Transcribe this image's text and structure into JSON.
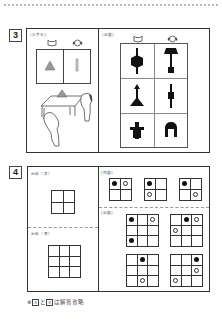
{
  "section3": {
    "number": "3",
    "model_panel": {
      "label": "[お手本]",
      "characters": [
        "cat-icon",
        "dog-icon"
      ],
      "cells": [
        "gray-triangle",
        "gray-bar"
      ]
    },
    "question_panel": {
      "label": "[出題]",
      "characters": [
        "cat-icon",
        "dog-icon"
      ],
      "rows": [
        [
          "hexagon-on-stick",
          "lamp-shape"
        ],
        [
          "arrow-on-triangle",
          "stick-with-square"
        ],
        [
          "cross-block",
          "arch-table"
        ]
      ]
    }
  },
  "section4": {
    "number": "4",
    "left_panel": {
      "top_label": "台紙（表）",
      "bottom_label": "台紙（裏）",
      "top_grid": {
        "rows": 2,
        "cols": 2
      },
      "bottom_grid": {
        "rows": 3,
        "cols": 3
      }
    },
    "right_panel": {
      "example_label": "[例題]",
      "question_label": "[出題]",
      "examples": [
        {
          "rows": 2,
          "cols": 2,
          "black": [
            [
              0,
              0
            ]
          ],
          "white": [
            [
              0,
              1
            ]
          ]
        },
        {
          "rows": 2,
          "cols": 2,
          "black": [
            [
              0,
              0
            ]
          ],
          "white": [
            [
              1,
              0
            ]
          ]
        },
        {
          "rows": 2,
          "cols": 2,
          "black": [
            [
              0,
              0
            ]
          ],
          "white": [
            [
              1,
              1
            ]
          ]
        }
      ],
      "questions": [
        {
          "rows": 3,
          "cols": 3,
          "black": [
            [
              0,
              0
            ],
            [
              2,
              0
            ]
          ],
          "white": [
            [
              0,
              2
            ]
          ]
        },
        {
          "rows": 3,
          "cols": 3,
          "black": [
            [
              0,
              1
            ]
          ],
          "white": [
            [
              0,
              2
            ],
            [
              1,
              0
            ]
          ]
        },
        {
          "rows": 3,
          "cols": 3,
          "black": [
            [
              0,
              1
            ]
          ],
          "white": [
            [
              2,
              1
            ]
          ]
        },
        {
          "rows": 3,
          "cols": 3,
          "black": [
            [
              0,
              2
            ]
          ],
          "white": [
            [
              1,
              2
            ],
            [
              2,
              0
            ]
          ]
        }
      ]
    }
  },
  "footer": {
    "prefix": "※",
    "ref1": "3",
    "conj": "と",
    "ref2": "4",
    "suffix": "は解答省略"
  }
}
